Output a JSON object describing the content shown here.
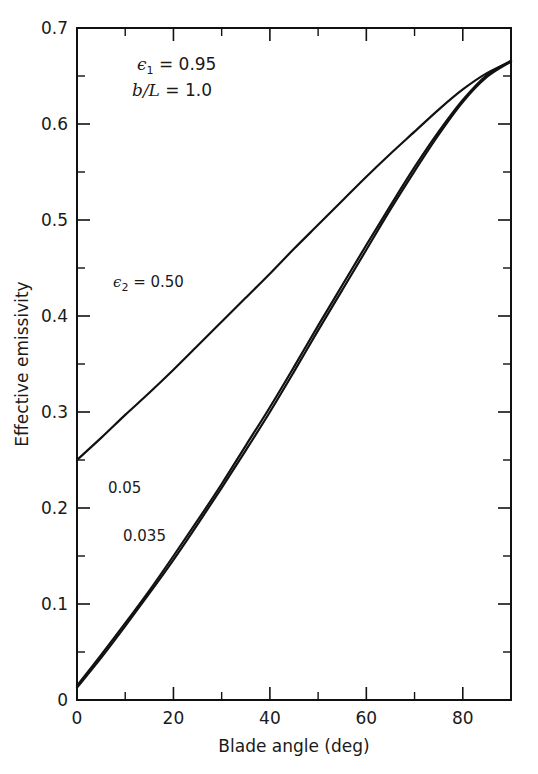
{
  "chart_data": {
    "type": "line",
    "title": "",
    "xlabel": "Blade angle (deg)",
    "ylabel": "Effective emissivity",
    "xlim": [
      0,
      90
    ],
    "ylim": [
      0,
      0.7
    ],
    "xticks": [
      0,
      20,
      40,
      60,
      80
    ],
    "xtick_labels": [
      "0",
      "20",
      "40",
      "60",
      "80"
    ],
    "xminor_ticks": [
      10,
      30,
      50,
      70,
      90
    ],
    "yticks": [
      0.1,
      0.2,
      0.3,
      0.4,
      0.5,
      0.6,
      0.7
    ],
    "ytick_labels": [
      "0.1",
      "0.2",
      "0.3",
      "0.4",
      "0.5",
      "0.6",
      "0.7"
    ],
    "yminor_ticks": [
      0.05,
      0.15,
      0.25,
      0.35,
      0.45,
      0.55,
      0.65
    ],
    "y_origin_label": "0",
    "grid": false,
    "legend_position": "inline-labels",
    "annotations": [
      {
        "name": "epsilon1",
        "symbol": "ϵ",
        "subscript": "1",
        "relation": "=",
        "value": "0.95",
        "x_deg": 18,
        "y_val": 0.655
      },
      {
        "name": "b-over-L",
        "text": "b/L",
        "relation": "=",
        "value": "1.0",
        "x_deg": 18,
        "y_val": 0.625
      }
    ],
    "series": [
      {
        "name": "epsilon2 = 0.50",
        "label": "0.50",
        "label_prefix_symbol": "ϵ",
        "label_subscript": "2",
        "label_relation": "=",
        "color": "#111111",
        "x": [
          0,
          5,
          10,
          15,
          20,
          25,
          30,
          35,
          40,
          45,
          50,
          55,
          60,
          65,
          70,
          75,
          80,
          85,
          90
        ],
        "y": [
          0.25,
          0.273,
          0.297,
          0.32,
          0.344,
          0.369,
          0.394,
          0.419,
          0.444,
          0.47,
          0.495,
          0.52,
          0.545,
          0.569,
          0.592,
          0.615,
          0.636,
          0.653,
          0.665
        ]
      },
      {
        "name": "epsilon2 = 0.05",
        "label": "0.05",
        "color": "#111111",
        "x": [
          0,
          5,
          10,
          15,
          20,
          25,
          30,
          35,
          40,
          45,
          50,
          55,
          60,
          65,
          70,
          75,
          80,
          85,
          90
        ],
        "y": [
          0.015,
          0.047,
          0.08,
          0.114,
          0.15,
          0.187,
          0.225,
          0.265,
          0.305,
          0.347,
          0.39,
          0.432,
          0.474,
          0.515,
          0.555,
          0.592,
          0.625,
          0.651,
          0.666
        ]
      },
      {
        "name": "epsilon2 = 0.035",
        "label": "0.035",
        "color": "#111111",
        "x": [
          0,
          5,
          10,
          15,
          20,
          25,
          30,
          35,
          40,
          45,
          50,
          55,
          60,
          65,
          70,
          75,
          80,
          85,
          90
        ],
        "y": [
          0.013,
          0.044,
          0.077,
          0.111,
          0.146,
          0.183,
          0.221,
          0.26,
          0.3,
          0.342,
          0.385,
          0.427,
          0.469,
          0.511,
          0.551,
          0.589,
          0.623,
          0.649,
          0.665
        ]
      }
    ],
    "curve_labels": [
      {
        "name": "curve-label-050",
        "text": "0.50",
        "x_px": 196,
        "y_px": 287
      },
      {
        "name": "curve-label-005",
        "text": "0.05",
        "x_px": 108,
        "y_px": 493
      },
      {
        "name": "curve-label-0035",
        "text": "0.035",
        "x_px": 123,
        "y_px": 541
      }
    ]
  },
  "axis": {
    "x_title": "Blade angle (deg)",
    "y_title": "Effective emissivity"
  }
}
